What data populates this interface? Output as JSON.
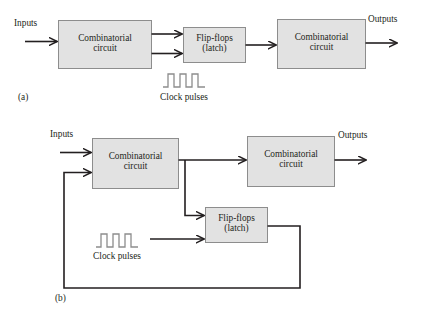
{
  "figure": {
    "background_color": "#ffffff",
    "line_color": "#231f20",
    "box_fill_color": "#e2e2e2",
    "box_stroke_color": "#8d8d8d"
  },
  "diagram_a": {
    "part_label": "(a)",
    "input_label": "Inputs",
    "output_label": "Outputs",
    "clock_label": "Clock pulses",
    "blocks": [
      {
        "id": "comb1",
        "line1": "Combinatorial",
        "line2": "circuit"
      },
      {
        "id": "flipflops",
        "line1": "Flip-flops",
        "line2": "(latch)"
      },
      {
        "id": "comb2",
        "line1": "Combinatorial",
        "line2": "circuit"
      }
    ]
  },
  "diagram_b": {
    "part_label": "(b)",
    "input_label": "Inputs",
    "output_label": "Outputs",
    "clock_label": "Clock pulses",
    "blocks": [
      {
        "id": "comb1",
        "line1": "Combinatorial",
        "line2": "circuit"
      },
      {
        "id": "comb2",
        "line1": "Combinatorial",
        "line2": "circuit"
      },
      {
        "id": "flipflops",
        "line1": "Flip-flops",
        "line2": "(latch)"
      }
    ]
  }
}
